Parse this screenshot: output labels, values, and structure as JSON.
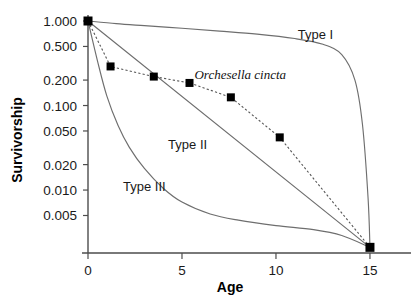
{
  "chart_data": {
    "type": "line",
    "title": "",
    "xlabel": "Age",
    "ylabel": "Survivorship",
    "yscale": "log",
    "ylim": [
      0.0018,
      1.0
    ],
    "xlim": [
      0,
      15.8
    ],
    "grid": false,
    "legend_position": "inline-annotations",
    "xticks": [
      0,
      5,
      10,
      15
    ],
    "xtick_labels": [
      "0",
      "5",
      "10",
      "15"
    ],
    "yticks": [
      1.0,
      0.5,
      0.2,
      0.1,
      0.05,
      0.02,
      0.01,
      0.005
    ],
    "ytick_labels": [
      "1.000",
      "0.500",
      "0.200",
      "0.100",
      "0.050",
      "0.020",
      "0.010",
      "0.005"
    ],
    "series": [
      {
        "name": "Orchesella cincta",
        "style": "dotted-line-with-filled-square-markers",
        "x": [
          0,
          1.2,
          3.5,
          5.4,
          7.6,
          10.2,
          15.0
        ],
        "values": [
          1.0,
          0.29,
          0.22,
          0.185,
          0.125,
          0.042,
          0.0021
        ]
      },
      {
        "name": "Type I",
        "style": "solid-line",
        "x": [
          0,
          1.5,
          3,
          5,
          7,
          9,
          11,
          12.5,
          13.5,
          14.2,
          14.6,
          14.9,
          15.0
        ],
        "values": [
          1.0,
          0.93,
          0.88,
          0.82,
          0.76,
          0.7,
          0.62,
          0.53,
          0.4,
          0.2,
          0.06,
          0.008,
          0.0021
        ]
      },
      {
        "name": "Type II",
        "style": "solid-line-straight-on-log-scale",
        "x": [
          0,
          15.0
        ],
        "values": [
          1.0,
          0.0021
        ]
      },
      {
        "name": "Type III",
        "style": "solid-line",
        "x": [
          0,
          0.5,
          1,
          1.6,
          2.2,
          3,
          4,
          5,
          6.5,
          8,
          10,
          12,
          13.5,
          15.0
        ],
        "values": [
          1.0,
          0.34,
          0.13,
          0.058,
          0.032,
          0.018,
          0.0105,
          0.0072,
          0.0052,
          0.0044,
          0.0038,
          0.0034,
          0.0029,
          0.0021
        ]
      }
    ],
    "annotations": [
      {
        "text": "Type I",
        "x": 12.1,
        "y": 0.62
      },
      {
        "text": "Orchesella cincta",
        "x": 8.1,
        "y": 0.205
      },
      {
        "text": "Type II",
        "x": 5.3,
        "y": 0.031
      },
      {
        "text": "Type III",
        "x": 3.0,
        "y": 0.0098
      }
    ],
    "colors": {
      "reference_curve": "#6e6e6e",
      "data_line": "#555555",
      "marker": "#000000",
      "axis": "#4d4d4d",
      "text": "#1a1a1a",
      "background": "#ffffff"
    }
  }
}
